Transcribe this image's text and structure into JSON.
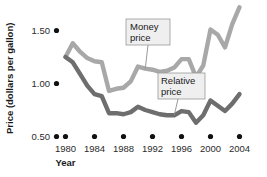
{
  "chart_data": {
    "type": "line",
    "title": "",
    "xlabel": "Year",
    "ylabel": "Price (dollars per gallon)",
    "xlim": [
      1979,
      2004.5
    ],
    "ylim": [
      0.5,
      1.75
    ],
    "xticks": [
      1980,
      1984,
      1988,
      1992,
      1996,
      2000,
      2004
    ],
    "xticklabels": [
      "1980",
      "1984",
      "1988",
      "1992",
      "1996",
      "2000",
      "2004"
    ],
    "yticks": [
      0.5,
      1.0,
      1.5
    ],
    "yticklabels": [
      "0.50",
      "1.00",
      "1.50"
    ],
    "grid": false,
    "legend_position": "inline-callouts",
    "x": [
      1980,
      1981,
      1982,
      1983,
      1984,
      1985,
      1986,
      1987,
      1988,
      1989,
      1990,
      1991,
      1992,
      1993,
      1994,
      1995,
      1996,
      1997,
      1998,
      1999,
      2000,
      2001,
      2002,
      2003,
      2004
    ],
    "series": [
      {
        "name": "Money price",
        "color": "#a8a8a8",
        "values": [
          1.25,
          1.38,
          1.3,
          1.24,
          1.21,
          1.2,
          0.93,
          0.95,
          0.96,
          1.02,
          1.16,
          1.14,
          1.13,
          1.11,
          1.12,
          1.15,
          1.23,
          1.23,
          1.06,
          1.17,
          1.51,
          1.46,
          1.34,
          1.56,
          1.72
        ]
      },
      {
        "name": "Relative price",
        "color": "#6e6e6e",
        "values": [
          1.25,
          1.2,
          1.09,
          0.98,
          0.9,
          0.88,
          0.72,
          0.72,
          0.71,
          0.73,
          0.78,
          0.75,
          0.73,
          0.71,
          0.7,
          0.7,
          0.74,
          0.73,
          0.63,
          0.7,
          0.84,
          0.79,
          0.74,
          0.81,
          0.9
        ]
      }
    ],
    "annotations": [
      {
        "label_line1": "Money",
        "label_line2": "price",
        "target_series": "Money price"
      },
      {
        "label_line1": "Relative",
        "label_line2": "price",
        "target_series": "Relative price"
      }
    ]
  },
  "axes": {
    "y_title": "Price (dollars per gallon)",
    "x_title": "Year"
  }
}
